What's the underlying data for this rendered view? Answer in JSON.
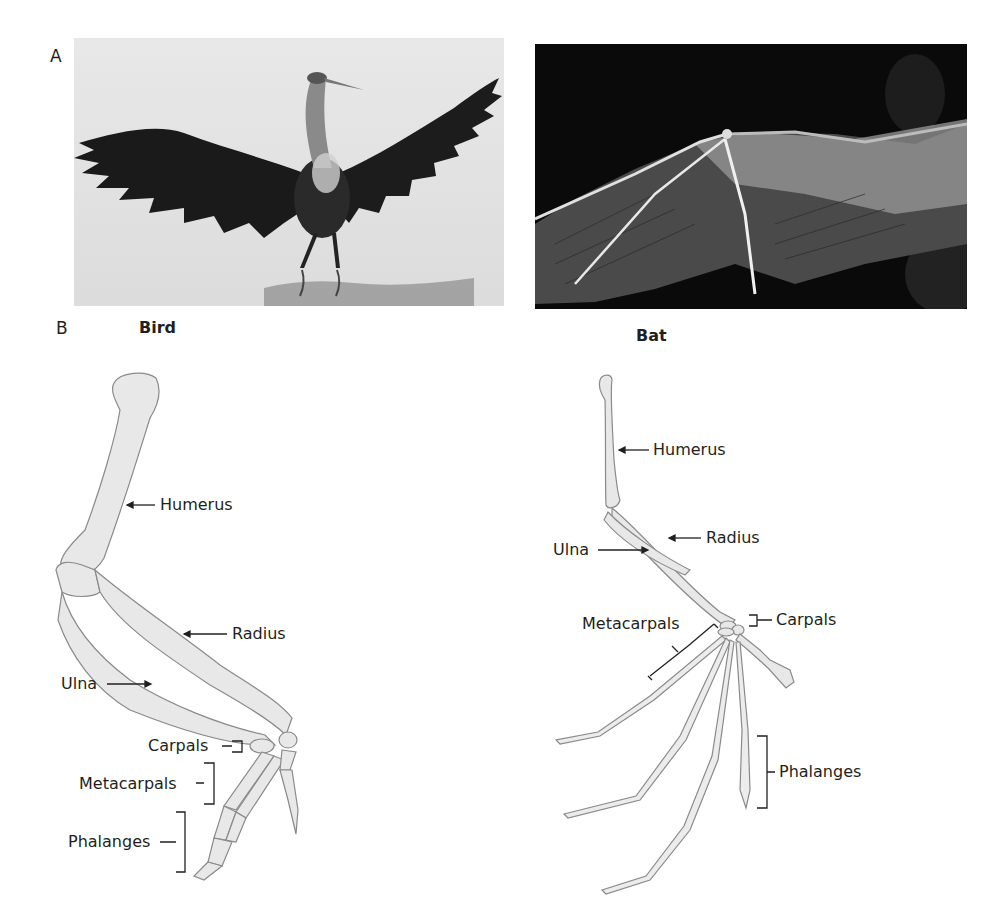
{
  "panel_a": {
    "letter": "A",
    "photos": [
      {
        "subject": "heron",
        "description": "Great blue heron standing in shallow water with wings outstretched"
      },
      {
        "subject": "bat-wing",
        "description": "Close-up of a bat wing membrane against dark background"
      }
    ]
  },
  "panel_b": {
    "letter": "B",
    "bird": {
      "heading": "Bird",
      "labels": {
        "humerus": "Humerus",
        "radius": "Radius",
        "ulna": "Ulna",
        "carpals": "Carpals",
        "metacarpals": "Metacarpals",
        "phalanges": "Phalanges"
      }
    },
    "bat": {
      "heading": "Bat",
      "labels": {
        "humerus": "Humerus",
        "radius": "Radius",
        "ulna": "Ulna",
        "carpals": "Carpals",
        "metacarpals": "Metacarpals",
        "phalanges": "Phalanges"
      }
    }
  },
  "colors": {
    "bone_fill": "#e8e8e8",
    "bone_stroke": "#8a8a8a",
    "text": "#231f20",
    "heron_bg": "#e6e6e6",
    "bat_bg": "#0a0a0a"
  }
}
